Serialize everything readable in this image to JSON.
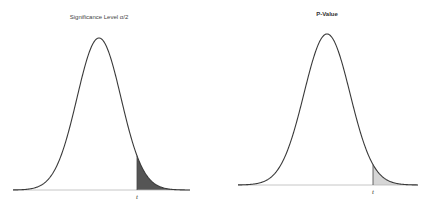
{
  "panels": [
    {
      "title": "Significance Level α/2",
      "tick_label": "t",
      "shade_color": "#555555",
      "curve": {
        "peak_x": 99,
        "peak_y": 38,
        "baseline_y": 190,
        "x_start": 13,
        "x_end": 190,
        "sigma_px": 22
      },
      "cutoff_x": 137
    },
    {
      "title": "P-Value",
      "tick_label": "t",
      "shade_color": "#d6d6d6",
      "curve": {
        "peak_x": 327,
        "peak_y": 34,
        "baseline_y": 185,
        "x_start": 238,
        "x_end": 418,
        "sigma_px": 23
      },
      "cutoff_x": 373
    }
  ]
}
